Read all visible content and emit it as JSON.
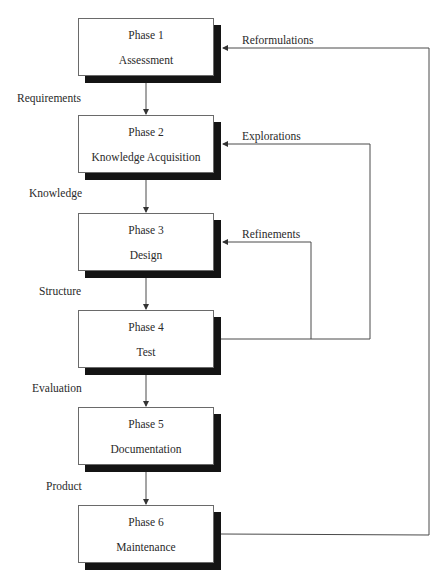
{
  "diagram": {
    "type": "waterfall-with-feedback",
    "phases": [
      {
        "number": "Phase 1",
        "name": "Assessment"
      },
      {
        "number": "Phase 2",
        "name": "Knowledge Acquisition"
      },
      {
        "number": "Phase 3",
        "name": "Design"
      },
      {
        "number": "Phase 4",
        "name": "Test"
      },
      {
        "number": "Phase 5",
        "name": "Documentation"
      },
      {
        "number": "Phase 6",
        "name": "Maintenance"
      }
    ],
    "flow_labels": [
      "Requirements",
      "Knowledge",
      "Structure",
      "Evaluation",
      "Product"
    ],
    "feedback_labels": {
      "reformulations": "Reformulations",
      "explorations": "Explorations",
      "refinements": "Refinements"
    },
    "edges": [
      {
        "from": "Phase 1",
        "to": "Phase 2",
        "label": "Requirements"
      },
      {
        "from": "Phase 2",
        "to": "Phase 3",
        "label": "Knowledge"
      },
      {
        "from": "Phase 3",
        "to": "Phase 4",
        "label": "Structure"
      },
      {
        "from": "Phase 4",
        "to": "Phase 5",
        "label": "Evaluation"
      },
      {
        "from": "Phase 5",
        "to": "Phase 6",
        "label": "Product"
      },
      {
        "from": "Phase 4",
        "to": "Phase 3",
        "label": "Refinements"
      },
      {
        "from": "Phase 4",
        "to": "Phase 2",
        "label": "Explorations"
      },
      {
        "from": "Phase 6",
        "to": "Phase 1",
        "label": "Reformulations"
      }
    ],
    "colors": {
      "line": "#4a4a4a",
      "shadow": "#141414",
      "box_fill": "#ffffff",
      "background": "#ffffff"
    }
  }
}
